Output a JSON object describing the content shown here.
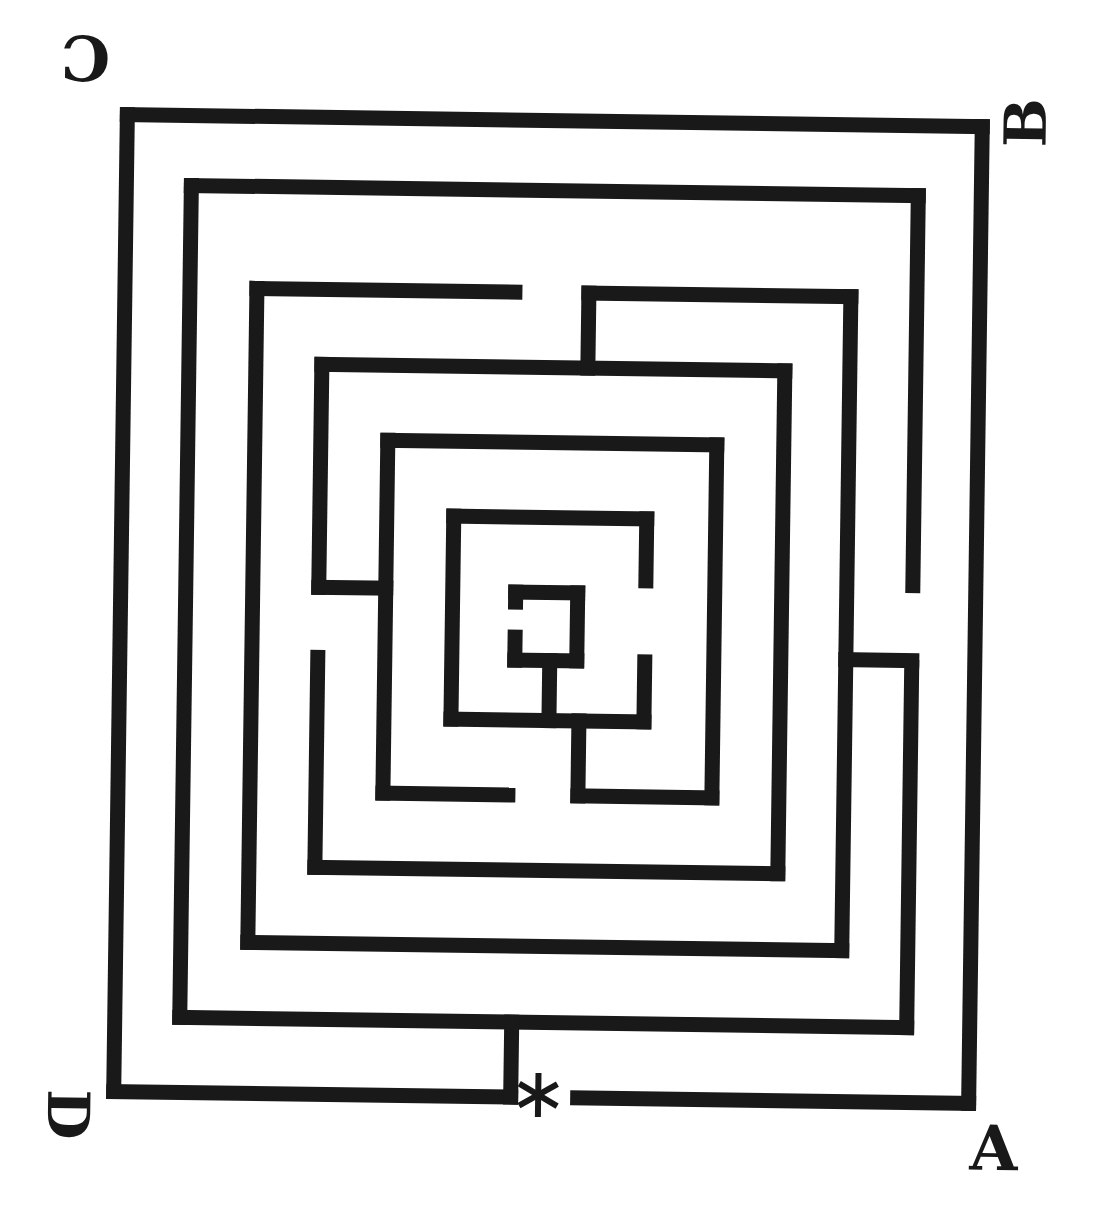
{
  "canvas": {
    "width": 1094,
    "height": 1217,
    "background_color": "#ffffff",
    "ink_color": "#191919",
    "scan_rotation_deg": 0.8,
    "rotation_center": [
      547,
      608
    ]
  },
  "maze": {
    "description": "square-labyrinth",
    "wall_thickness": 15,
    "walls": [
      {
        "n": "ring1-top",
        "x": 113,
        "y": 113,
        "w": 870,
        "h": 15
      },
      {
        "n": "ring1-left",
        "x": 113,
        "y": 113,
        "w": 15,
        "h": 992
      },
      {
        "n": "ring1-right",
        "x": 968,
        "y": 113,
        "w": 15,
        "h": 992
      },
      {
        "n": "ring1-bottom-left",
        "x": 113,
        "y": 1090,
        "w": 412,
        "h": 15
      },
      {
        "n": "ring1-bottom-right",
        "x": 577,
        "y": 1090,
        "w": 406,
        "h": 15
      },
      {
        "n": "ring2-top",
        "x": 178,
        "y": 183,
        "w": 742,
        "h": 15
      },
      {
        "n": "ring2-left",
        "x": 178,
        "y": 183,
        "w": 15,
        "h": 847
      },
      {
        "n": "ring2-bottom",
        "x": 178,
        "y": 1015,
        "w": 742,
        "h": 15
      },
      {
        "n": "ring2-right-upper",
        "x": 905,
        "y": 183,
        "w": 15,
        "h": 405
      },
      {
        "n": "ring2-right-lower",
        "x": 905,
        "y": 655,
        "w": 15,
        "h": 375
      },
      {
        "n": "ring3-top-left",
        "x": 245,
        "y": 285,
        "w": 273,
        "h": 15
      },
      {
        "n": "ring3-top-right",
        "x": 577,
        "y": 285,
        "w": 277,
        "h": 15
      },
      {
        "n": "ring3-left",
        "x": 245,
        "y": 285,
        "w": 15,
        "h": 669
      },
      {
        "n": "ring3-right",
        "x": 839,
        "y": 285,
        "w": 15,
        "h": 669
      },
      {
        "n": "ring3-bottom",
        "x": 245,
        "y": 939,
        "w": 609,
        "h": 15
      },
      {
        "n": "ring4-top",
        "x": 311,
        "y": 360,
        "w": 478,
        "h": 15
      },
      {
        "n": "ring4-right",
        "x": 774,
        "y": 360,
        "w": 15,
        "h": 518
      },
      {
        "n": "ring4-bottom",
        "x": 311,
        "y": 863,
        "w": 478,
        "h": 15
      },
      {
        "n": "ring4-left-upper",
        "x": 311,
        "y": 360,
        "w": 15,
        "h": 238
      },
      {
        "n": "ring4-left-lower",
        "x": 311,
        "y": 653,
        "w": 15,
        "h": 225
      },
      {
        "n": "ring5-top",
        "x": 378,
        "y": 435,
        "w": 344,
        "h": 15
      },
      {
        "n": "ring5-left",
        "x": 378,
        "y": 435,
        "w": 15,
        "h": 368
      },
      {
        "n": "ring5-right",
        "x": 707,
        "y": 435,
        "w": 15,
        "h": 368
      },
      {
        "n": "ring5-bottom-left",
        "x": 378,
        "y": 788,
        "w": 140,
        "h": 15
      },
      {
        "n": "ring5-bottom-right",
        "x": 573,
        "y": 788,
        "w": 149,
        "h": 15
      },
      {
        "n": "ring6-top",
        "x": 445,
        "y": 510,
        "w": 208,
        "h": 15
      },
      {
        "n": "ring6-left",
        "x": 445,
        "y": 510,
        "w": 15,
        "h": 218
      },
      {
        "n": "ring6-bottom",
        "x": 445,
        "y": 713,
        "w": 208,
        "h": 15
      },
      {
        "n": "ring6-right-upper",
        "x": 638,
        "y": 510,
        "w": 15,
        "h": 77
      },
      {
        "n": "ring6-right-lower",
        "x": 638,
        "y": 653,
        "w": 15,
        "h": 75
      },
      {
        "n": "entrance-baffle",
        "x": 510,
        "y": 1015,
        "w": 15,
        "h": 90
      },
      {
        "n": "top-center-baffle",
        "x": 577,
        "y": 285,
        "w": 15,
        "h": 90
      },
      {
        "n": "left-mid-baffle",
        "x": 311,
        "y": 583,
        "w": 82,
        "h": 15
      },
      {
        "n": "right-mid-baffle",
        "x": 839,
        "y": 648,
        "w": 81,
        "h": 15
      },
      {
        "n": "center-stem-outer",
        "x": 573,
        "y": 713,
        "w": 15,
        "h": 90
      },
      {
        "n": "center-stem-inner",
        "x": 543,
        "y": 653,
        "w": 15,
        "h": 75
      },
      {
        "n": "core-top",
        "x": 508,
        "y": 585,
        "w": 77,
        "h": 15
      },
      {
        "n": "core-right",
        "x": 570,
        "y": 585,
        "w": 15,
        "h": 83
      },
      {
        "n": "core-bottom",
        "x": 508,
        "y": 653,
        "w": 77,
        "h": 15
      },
      {
        "n": "core-left-upper",
        "x": 508,
        "y": 585,
        "w": 15,
        "h": 25
      },
      {
        "n": "core-left-lower",
        "x": 508,
        "y": 630,
        "w": 15,
        "h": 38
      }
    ]
  },
  "corner_labels": [
    {
      "id": "corner-label-c",
      "char": "C",
      "x": 78,
      "y": 64,
      "rotation": 180,
      "font_size": 62
    },
    {
      "id": "corner-label-b",
      "char": "B",
      "x": 1019,
      "y": 116,
      "rotation": -90,
      "font_size": 58
    },
    {
      "id": "corner-label-d",
      "char": "D",
      "x": 75,
      "y": 1121,
      "rotation": 90,
      "font_size": 58
    },
    {
      "id": "corner-label-a",
      "char": "A",
      "x": 1001,
      "y": 1142,
      "rotation": 0,
      "font_size": 62
    }
  ],
  "entrance_marker": {
    "symbol": "*",
    "x": 545,
    "y": 1095,
    "arm_radius": 22,
    "arm_angles_deg": [
      90,
      30,
      150
    ],
    "stroke_width": 6
  }
}
